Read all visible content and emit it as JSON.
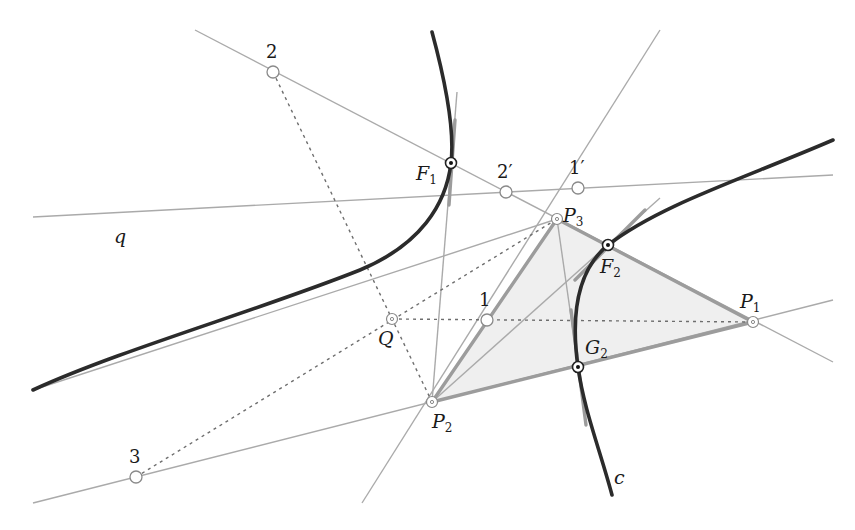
{
  "diagram": {
    "title": "",
    "colors": {
      "curve": "#2b2b2b",
      "line": "#a8a8a8",
      "thick_line": "#9a9a9a",
      "dotted": "#6e6e6e",
      "triangle_fill": "#ececec",
      "point_stroke": "#8a8a8a"
    },
    "curve_label": "c",
    "line_label": "q",
    "points": {
      "F1": {
        "label": "F",
        "sub": "1",
        "x": 451,
        "y": 163
      },
      "F2": {
        "label": "F",
        "sub": "2",
        "x": 608,
        "y": 245
      },
      "G2": {
        "label": "G",
        "sub": "2",
        "x": 578,
        "y": 367
      },
      "P1": {
        "label": "P",
        "sub": "1",
        "x": 753,
        "y": 322
      },
      "P2": {
        "label": "P",
        "sub": "2",
        "x": 432,
        "y": 402
      },
      "P3": {
        "label": "P",
        "sub": "3",
        "x": 557,
        "y": 219
      },
      "Q": {
        "label": "Q",
        "x": 392,
        "y": 319
      },
      "pt1": {
        "label": "1",
        "x": 487,
        "y": 320
      },
      "pt2": {
        "label": "2",
        "x": 273,
        "y": 72
      },
      "pt3": {
        "label": "3",
        "x": 136,
        "y": 477
      },
      "pt1p": {
        "label": "1′",
        "x": 578,
        "y": 188
      },
      "pt2p": {
        "label": "2′",
        "x": 506,
        "y": 192
      }
    }
  }
}
